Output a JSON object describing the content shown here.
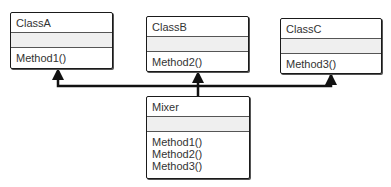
{
  "diagram": {
    "type": "uml-class-diagram",
    "classes": [
      {
        "id": "classA",
        "name": "ClassA",
        "attributes": [],
        "methods": [
          "Method1()"
        ]
      },
      {
        "id": "classB",
        "name": "ClassB",
        "attributes": [],
        "methods": [
          "Method2()"
        ]
      },
      {
        "id": "classC",
        "name": "ClassC",
        "attributes": [],
        "methods": [
          "Method3()"
        ]
      },
      {
        "id": "mixer",
        "name": "Mixer",
        "attributes": [],
        "methods": [
          "Method1()",
          "Method2()",
          "Method3()"
        ]
      }
    ],
    "relationships": [
      {
        "from": "Mixer",
        "to": "ClassA",
        "type": "generalization"
      },
      {
        "from": "Mixer",
        "to": "ClassB",
        "type": "generalization"
      },
      {
        "from": "Mixer",
        "to": "ClassC",
        "type": "generalization"
      }
    ],
    "colors": {
      "line": "#111111",
      "border": "#1a1a1a",
      "attr_fill": "#efefef",
      "text": "#333333"
    }
  }
}
